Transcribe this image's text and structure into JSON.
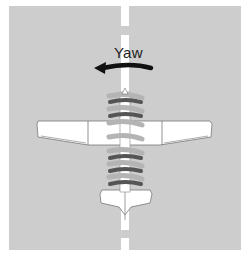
{
  "diagram": {
    "label": "Yaw",
    "arrow_direction": "left",
    "colors": {
      "background": "#cdcdcd",
      "centerline": "#ffffff",
      "arrow": "#111111",
      "slipstream_light": "#b4b4b4",
      "slipstream_dark": "#555555",
      "aircraft": "#ffffff",
      "outline": "#777777"
    },
    "elements": [
      "runway",
      "centerline",
      "yaw-arrow",
      "spiral-slipstream",
      "wing",
      "horizontal-stabilizer",
      "fuselage"
    ]
  }
}
